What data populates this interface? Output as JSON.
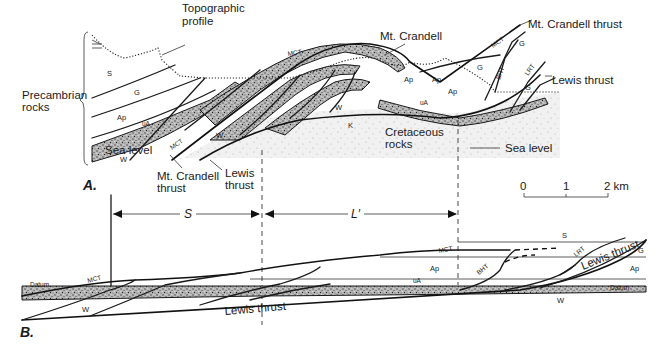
{
  "figure": {
    "panels": [
      "A.",
      "B."
    ],
    "panelA": {
      "labels": {
        "topographic_profile": [
          "Topographic",
          "profile"
        ],
        "precambrian_rocks": [
          "Precambrian",
          "rocks"
        ],
        "mt_crandell": "Mt. Crandell",
        "mt_crandell_thrust_top": "Mt. Crandell thrust",
        "lewis_thrust_right": "Lewis thrust",
        "cretaceous_rocks": [
          "Cretaceous",
          "rocks"
        ],
        "sea_level_left": "Sea level",
        "sea_level_right": "Sea level",
        "mt_crandell_thrust_bottom": [
          "Mt. Crandell",
          "thrust"
        ],
        "lewis_thrust_bottom": [
          "Lewis",
          "thrust"
        ]
      },
      "units": {
        "S": "S",
        "G": "G",
        "Ap": "Ap",
        "uA": "uA",
        "W": "W",
        "K": "K",
        "MCT": "MCT",
        "BHT": "BHT",
        "LRT": "LRT"
      }
    },
    "scale_bar": {
      "ticks": [
        "0",
        "1",
        "2 km"
      ]
    },
    "measure": {
      "S": "S",
      "L_prime": "L′"
    },
    "panelB": {
      "labels": {
        "datum_left": "Datum",
        "datum_right": "Datum",
        "lewis_thrust_bottom": "Lewis thrust",
        "lewis_thrust_right": "Lewis thrust"
      },
      "units": {
        "MCT": "MCT",
        "W": "W",
        "Ap": "Ap",
        "uA": "uA",
        "S": "S",
        "G": "G",
        "BHT": "BHT",
        "LRT": "LRT"
      }
    }
  }
}
